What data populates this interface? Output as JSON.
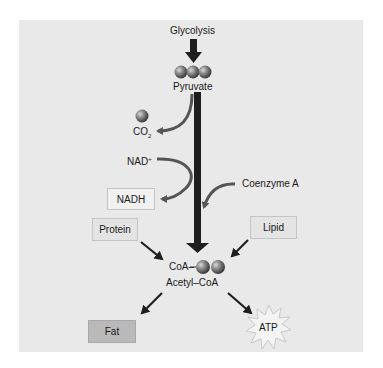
{
  "diagram": {
    "title_input": "Glycolysis",
    "pyruvate": {
      "label": "Pyruvate",
      "carbon_spheres": 3
    },
    "co2": {
      "label": "CO",
      "subscript": "2",
      "carbon_spheres": 1
    },
    "nad": {
      "label": "NAD",
      "superscript": "+"
    },
    "nadh": {
      "label": "NADH"
    },
    "coenzyme_a": {
      "label": "Coenzyme A"
    },
    "protein": {
      "label": "Protein"
    },
    "lipid": {
      "label": "Lipid"
    },
    "acetyl_coa": {
      "prefix": "CoA–",
      "label": "Acetyl–CoA",
      "carbon_spheres": 2
    },
    "fat": {
      "label": "Fat"
    },
    "atp": {
      "label": "ATP"
    },
    "colors": {
      "panel": "#e9e9e9",
      "arrow": "#1e1e1e",
      "curved_arrow": "#555555",
      "fat_box": "#b9b9b9",
      "sphere": "#6a6a6a"
    }
  }
}
